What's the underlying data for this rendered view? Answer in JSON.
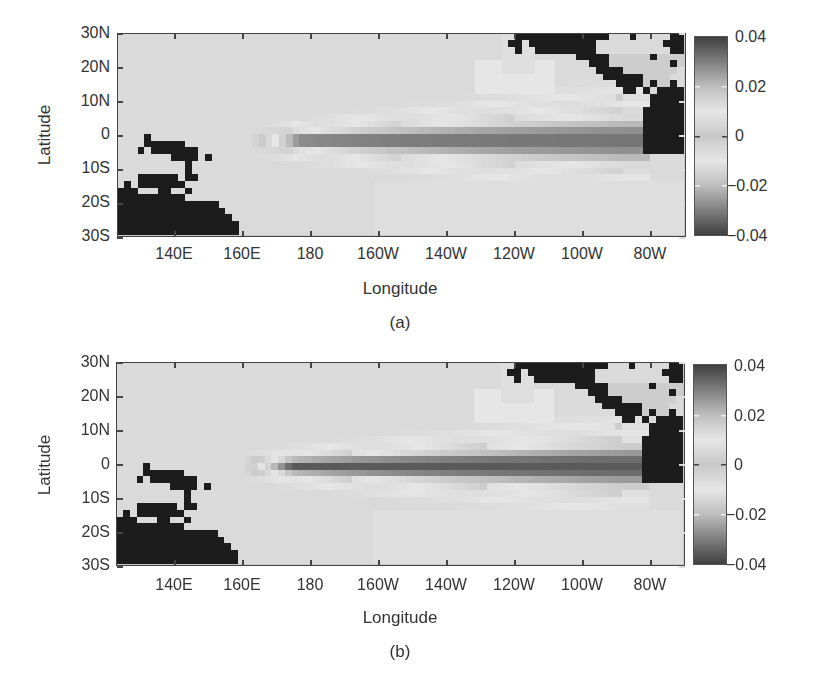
{
  "chart_data": [
    {
      "type": "heatmap",
      "panel": "(a)",
      "xlabel": "Longitude",
      "ylabel": "Latitude",
      "x_ticks": [
        "140E",
        "160E",
        "180",
        "160W",
        "140W",
        "120W",
        "100W",
        "80W"
      ],
      "y_ticks": [
        "30N",
        "20N",
        "10N",
        "0",
        "10S",
        "20S",
        "30S"
      ],
      "x_range": [
        "124E",
        "70W"
      ],
      "y_range": [
        "30S",
        "30N"
      ],
      "colorbar": {
        "min": -0.04,
        "max": 0.04,
        "ticks": [
          "0.04",
          "0.02",
          "0",
          "-0.02",
          "-0.04"
        ],
        "colormap": "grayscale, dark at both extremes, light near 0"
      },
      "grid_resolution_deg": 2,
      "field": {
        "description": "Equatorial tongue of strong (dark) values extending from ~170E to ~85W along 0-5S, bounded by light bands; background light gray elsewhere",
        "tongue_west_lon": 170,
        "tongue_east_lon": 275,
        "tongue_center_lat": -2,
        "tongue_halfwidth_lat_west": 3,
        "tongue_halfwidth_lat_east": 10,
        "peak_value": -0.032
      },
      "grid": {
        "cols": 84,
        "rows": 30,
        "lon0": 124,
        "lat0": 30
      }
    },
    {
      "type": "heatmap",
      "panel": "(b)",
      "xlabel": "Longitude",
      "ylabel": "Latitude",
      "x_ticks": [
        "140E",
        "160E",
        "180",
        "160W",
        "140W",
        "120W",
        "100W",
        "80W"
      ],
      "y_ticks": [
        "30N",
        "20N",
        "10N",
        "0",
        "10S",
        "20S",
        "30S"
      ],
      "x_range": [
        "124E",
        "70W"
      ],
      "y_range": [
        "30S",
        "30N"
      ],
      "colorbar": {
        "min": -0.04,
        "max": 0.04,
        "ticks": [
          "0.04",
          "0.02",
          "0",
          "-0.02",
          "-0.04"
        ],
        "colormap": "grayscale, dark at both extremes, light near 0"
      },
      "grid_resolution_deg": 2,
      "field": {
        "description": "Similar equatorial tongue, slightly narrower core with darkest band along equator from ~180 to ~95W",
        "tongue_west_lon": 168,
        "tongue_east_lon": 275,
        "tongue_center_lat": -1,
        "tongue_halfwidth_lat_west": 3,
        "tongue_halfwidth_lat_east": 9,
        "peak_value": -0.036
      },
      "grid": {
        "cols": 84,
        "rows": 30,
        "lon0": 124,
        "lat0": 30
      }
    }
  ],
  "land_mask": {
    "legend": "# = land (black), L = masked light region, . = ocean data",
    "rows": [
      "...........................................................##############...#.....##",
      "..........................................................##.##########..........###",
      "...........................................................#..#########...........##",
      "....................................................................#####LLLLLL#LLLL",
      "......................................................................###LLLLLLLLL#L",
      ".......................................................................####LLLLLLLL",
      "........................................................................######LLLL",
      "..........................................................................####L#LL#",
      "...........................................................................##.#.####",
      "..........................................................................L....######",
      "...............................................................................#####",
      "..............................................................................######",
      "..............................................................................######",
      "..............................................................................######",
      "..............................................................................######",
      "....#.........................................................................######",
      "....######....................................................................######",
      "...#.#######..................................................................######",
      "........####.#.......................................................................",
      "..........#..........................................................................",
      "..........#...........................................................................",
      "...######.##..........................................................................",
      ".#.#######..............................................................................",
      "###...##..#.............................................................................",
      "##########.............................................................................",
      "###############.......................................................................",
      "################......................................................................",
      "#################.....................................................................",
      "##################....................................................................",
      "##################...................................................................."
    ]
  },
  "panels": [
    {
      "caption": "(a)",
      "xlabel": "Longitude",
      "ylabel": "Latitude"
    },
    {
      "caption": "(b)",
      "xlabel": "Longitude",
      "ylabel": "Latitude"
    }
  ]
}
